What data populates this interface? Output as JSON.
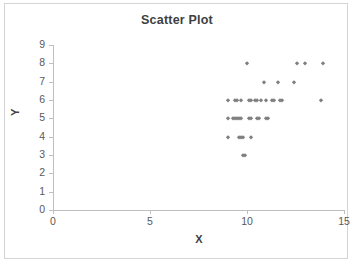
{
  "chart_data": {
    "type": "scatter",
    "title": "Scatter Plot",
    "xlabel": "X",
    "ylabel": "Y",
    "xlim": [
      0,
      15
    ],
    "ylim": [
      0,
      9
    ],
    "xticks": [
      0,
      5,
      10,
      15
    ],
    "yticks": [
      0,
      1,
      2,
      3,
      4,
      5,
      6,
      7,
      8,
      9
    ],
    "grid": false,
    "legend": false,
    "marker": "diamond",
    "marker_color": "#7f7f7f",
    "points": [
      {
        "x": 9.8,
        "y": 3.0
      },
      {
        "x": 9.9,
        "y": 3.0
      },
      {
        "x": 9.0,
        "y": 4.0
      },
      {
        "x": 9.6,
        "y": 4.0
      },
      {
        "x": 9.7,
        "y": 4.0
      },
      {
        "x": 9.8,
        "y": 4.0
      },
      {
        "x": 10.2,
        "y": 4.0
      },
      {
        "x": 9.0,
        "y": 5.0
      },
      {
        "x": 9.3,
        "y": 5.0
      },
      {
        "x": 9.4,
        "y": 5.0
      },
      {
        "x": 9.5,
        "y": 5.0
      },
      {
        "x": 9.6,
        "y": 5.0
      },
      {
        "x": 9.7,
        "y": 5.0
      },
      {
        "x": 10.1,
        "y": 5.0
      },
      {
        "x": 10.2,
        "y": 5.0
      },
      {
        "x": 10.5,
        "y": 5.0
      },
      {
        "x": 10.6,
        "y": 5.0
      },
      {
        "x": 11.0,
        "y": 5.0
      },
      {
        "x": 11.1,
        "y": 5.0
      },
      {
        "x": 9.0,
        "y": 6.0
      },
      {
        "x": 9.4,
        "y": 6.0
      },
      {
        "x": 9.5,
        "y": 6.0
      },
      {
        "x": 9.7,
        "y": 6.0
      },
      {
        "x": 10.1,
        "y": 6.0
      },
      {
        "x": 10.2,
        "y": 6.0
      },
      {
        "x": 10.4,
        "y": 6.0
      },
      {
        "x": 10.5,
        "y": 6.0
      },
      {
        "x": 10.7,
        "y": 6.0
      },
      {
        "x": 11.0,
        "y": 6.0
      },
      {
        "x": 11.3,
        "y": 6.0
      },
      {
        "x": 11.4,
        "y": 6.0
      },
      {
        "x": 11.7,
        "y": 6.0
      },
      {
        "x": 11.8,
        "y": 6.0
      },
      {
        "x": 13.8,
        "y": 6.0
      },
      {
        "x": 10.9,
        "y": 7.0
      },
      {
        "x": 11.6,
        "y": 7.0
      },
      {
        "x": 12.4,
        "y": 7.0
      },
      {
        "x": 10.0,
        "y": 8.0
      },
      {
        "x": 12.6,
        "y": 8.0
      },
      {
        "x": 13.0,
        "y": 8.0
      },
      {
        "x": 13.9,
        "y": 8.0
      }
    ]
  }
}
